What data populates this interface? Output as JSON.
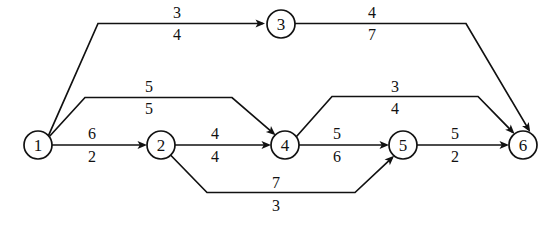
{
  "figure": {
    "type": "network-flow-diagram",
    "background_color": "#ffffff",
    "stroke_color": "#111111",
    "node_radius": 14
  },
  "nodes": [
    {
      "id": "1",
      "label": "1",
      "x": 38,
      "y": 145
    },
    {
      "id": "2",
      "label": "2",
      "x": 161,
      "y": 145
    },
    {
      "id": "3",
      "label": "3",
      "x": 281,
      "y": 24
    },
    {
      "id": "4",
      "label": "4",
      "x": 285,
      "y": 145
    },
    {
      "id": "5",
      "label": "5",
      "x": 403,
      "y": 145
    },
    {
      "id": "6",
      "label": "6",
      "x": 523,
      "y": 145
    }
  ],
  "edges": [
    {
      "id": "e13",
      "from": "1",
      "to": "3",
      "top_label": "3",
      "bottom_label": "4",
      "label_x": 177,
      "top_label_y": 12,
      "bottom_label_y": 34,
      "path": "M 48.7,135.1 L 98,23.5 L 263,23.5",
      "arrow": {
        "x": 265,
        "y": 23.5,
        "angle": 0
      }
    },
    {
      "id": "e36",
      "from": "3",
      "to": "6",
      "top_label": "4",
      "bottom_label": "7",
      "label_x": 372,
      "top_label_y": 12,
      "bottom_label_y": 34,
      "path": "M 295,23.5 L 466,23.5 L 528.6,129.4",
      "arrow": {
        "x": 530.2,
        "y": 132.1,
        "angle": 59.4
      }
    },
    {
      "id": "e14",
      "from": "1",
      "to": "4",
      "top_label": "5",
      "bottom_label": "5",
      "label_x": 149,
      "top_label_y": 86,
      "bottom_label_y": 108,
      "path": "M 49.6,136.2 L 85,97.5 L 232,97.5 L 273.5,133.4",
      "arrow": {
        "x": 275.6,
        "y": 135.2,
        "angle": 40.9
      }
    },
    {
      "id": "e12",
      "from": "1",
      "to": "2",
      "top_label": "6",
      "bottom_label": "2",
      "label_x": 92,
      "top_label_y": 133,
      "bottom_label_y": 156,
      "path": "M 52,145 L 143,145",
      "arrow": {
        "x": 147,
        "y": 145,
        "angle": 0
      }
    },
    {
      "id": "e24",
      "from": "2",
      "to": "4",
      "top_label": "4",
      "bottom_label": "4",
      "label_x": 215,
      "top_label_y": 133,
      "bottom_label_y": 156,
      "path": "M 175,145 L 267,145",
      "arrow": {
        "x": 271,
        "y": 145,
        "angle": 0
      }
    },
    {
      "id": "e46",
      "from": "4",
      "to": "6",
      "top_label": "3",
      "bottom_label": "4",
      "label_x": 395,
      "top_label_y": 86,
      "bottom_label_y": 108,
      "path": "M 296.5,136.5 L 332,96.5 L 478,96.5 L 512.5,131.8",
      "arrow": {
        "x": 514.6,
        "y": 133.9,
        "angle": 45.6
      }
    },
    {
      "id": "e45",
      "from": "4",
      "to": "5",
      "top_label": "5",
      "bottom_label": "6",
      "label_x": 337,
      "top_label_y": 133,
      "bottom_label_y": 156,
      "path": "M 299,145 L 385,145",
      "arrow": {
        "x": 389,
        "y": 145,
        "angle": 0
      }
    },
    {
      "id": "e25",
      "from": "2",
      "to": "5",
      "top_label": "7",
      "bottom_label": "3",
      "label_x": 276,
      "top_label_y": 182,
      "bottom_label_y": 205,
      "path": "M 170.5,155 L 207,192.5 L 355,192.5 L 392.2,157.6",
      "arrow": {
        "x": 394.1,
        "y": 155.8,
        "angle": -43.2
      }
    },
    {
      "id": "e56",
      "from": "5",
      "to": "6",
      "top_label": "5",
      "bottom_label": "2",
      "label_x": 455,
      "top_label_y": 133,
      "bottom_label_y": 156,
      "path": "M 417,145 L 505,145",
      "arrow": {
        "x": 509,
        "y": 145,
        "angle": 0
      }
    }
  ]
}
